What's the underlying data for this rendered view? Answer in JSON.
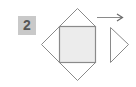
{
  "diagram": {
    "step_number": "2",
    "colors": {
      "badge_bg": "#c9c9c9",
      "badge_text": "#555555",
      "outline": "#8a8a8a",
      "square_fill": "#ececec",
      "background": "#ffffff"
    },
    "shapes": [
      {
        "name": "center-square",
        "type": "square",
        "filled": true
      },
      {
        "name": "top-triangle",
        "type": "triangle",
        "attached_to": "top"
      },
      {
        "name": "left-triangle",
        "type": "triangle",
        "attached_to": "left"
      },
      {
        "name": "bottom-triangle",
        "type": "triangle",
        "attached_to": "bottom"
      },
      {
        "name": "detached-right-triangle",
        "type": "triangle",
        "pointing": "right"
      },
      {
        "name": "motion-arrow",
        "type": "arrow",
        "direction": "right"
      }
    ]
  }
}
